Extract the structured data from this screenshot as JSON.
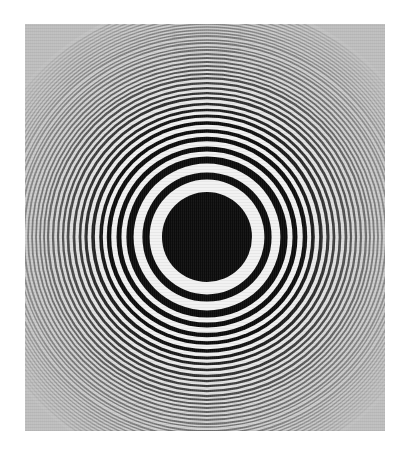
{
  "figure": {
    "center": [
      182,
      213
    ],
    "central_disk_radius": 45,
    "dark_ring_radii": [
      61,
      77,
      88,
      98,
      106,
      114,
      121,
      127,
      133,
      139,
      144,
      149,
      154,
      159,
      163,
      167,
      171,
      175,
      179,
      183,
      187,
      190,
      194,
      197,
      201,
      204,
      207,
      210,
      213,
      216,
      219,
      222,
      225,
      228,
      231,
      234
    ],
    "colors": {
      "background": "#b9b9b9",
      "dark": "#0c0c0c",
      "light": "#f2f2f2"
    }
  }
}
